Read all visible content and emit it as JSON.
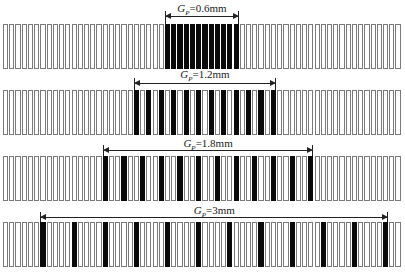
{
  "figure": {
    "total_bars": 64,
    "bar_start_x": 3,
    "bar_pitch": 6.23,
    "bar_width": 5.2,
    "outline_color": "#7a7a7a",
    "fill_color": "#0a0a0a",
    "rows": [
      {
        "id": "row-1",
        "label_symbol": "G",
        "label_subscript": "P",
        "label_value": "=0.6mm",
        "period": 1,
        "first_black": 26,
        "black_count": 12,
        "top": 24,
        "height": 45,
        "label_y": 2,
        "arrow_y": 16
      },
      {
        "id": "row-2",
        "label_symbol": "G",
        "label_subscript": "P",
        "label_value": "=1.2mm",
        "period": 2,
        "first_black": 21,
        "black_count": 12,
        "top": 90,
        "height": 45,
        "label_y": 68,
        "arrow_y": 83
      },
      {
        "id": "row-3",
        "label_symbol": "G",
        "label_subscript": "P",
        "label_value": "=1.8mm",
        "period": 3,
        "first_black": 16,
        "black_count": 12,
        "top": 156,
        "height": 45,
        "label_y": 137,
        "arrow_y": 150
      },
      {
        "id": "row-4",
        "label_symbol": "G",
        "label_subscript": "P",
        "label_value": "=3mm",
        "period": 5,
        "first_black": 6,
        "black_count": 12,
        "top": 222,
        "height": 45,
        "label_y": 204,
        "arrow_y": 217
      }
    ]
  }
}
